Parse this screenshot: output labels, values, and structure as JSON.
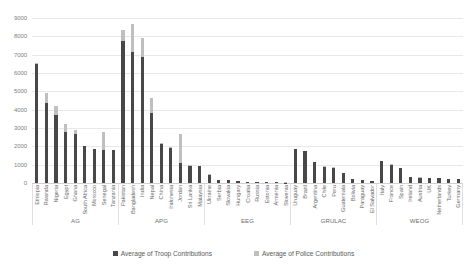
{
  "chart_data": {
    "type": "bar",
    "stacked": true,
    "title": "",
    "subtitle": "",
    "xlabel": "",
    "ylabel": "",
    "ylim": [
      0,
      9000
    ],
    "yticks": [
      0,
      1000,
      2000,
      3000,
      4000,
      5000,
      6000,
      7000,
      8000,
      9000
    ],
    "ytick_labels": [
      "0",
      "1000",
      "2000",
      "3000",
      "4000",
      "5000",
      "6000",
      "7000",
      "8000",
      "9000"
    ],
    "grid": true,
    "legend_position": "bottom",
    "categories": [
      "Ethiopia",
      "Rwanda",
      "Nigeria",
      "Egypt",
      "Ghana",
      "South Africa",
      "Morocco",
      "Senegal",
      "Tanzania",
      "Pakistan",
      "Bangladesh",
      "India",
      "Nepal",
      "China",
      "Indonesia",
      "Jordan",
      "Sri Lanka",
      "Malaysia",
      "Ukraine",
      "Serbia",
      "Slovakia",
      "Hungary",
      "Croatia",
      "Russia",
      "Estonia",
      "Armenia",
      "Slovenia",
      "Uruguay",
      "Brazil",
      "Argentina",
      "Chile",
      "Peru",
      "Guatemala",
      "Bolivia",
      "Paraguay",
      "El Salvador",
      "Italy",
      "France",
      "Spain",
      "Ireland",
      "Austria",
      "UK",
      "Netherlands",
      "Turkey",
      "Germany"
    ],
    "series": [
      {
        "name": "Average of Troop Contributions",
        "color": "#484848",
        "values": [
          6490,
          4350,
          3700,
          2800,
          2650,
          2000,
          1850,
          1790,
          1780,
          7760,
          7150,
          6900,
          3800,
          2150,
          1930,
          1100,
          950,
          920,
          450,
          160,
          150,
          90,
          70,
          60,
          45,
          35,
          25,
          1860,
          1750,
          1150,
          900,
          840,
          520,
          200,
          170,
          120,
          1200,
          1000,
          820,
          330,
          300,
          290,
          250,
          230,
          210
        ]
      },
      {
        "name": "Average of Police Contributions",
        "color": "#bfbfbf",
        "values": [
          30,
          560,
          490,
          400,
          240,
          20,
          15,
          1010,
          15,
          590,
          1550,
          1010,
          820,
          15,
          40,
          1600,
          20,
          15,
          20,
          10,
          10,
          8,
          6,
          6,
          5,
          4,
          4,
          20,
          15,
          20,
          15,
          15,
          15,
          10,
          8,
          8,
          15,
          15,
          15,
          10,
          10,
          10,
          8,
          8,
          8
        ]
      }
    ],
    "groups": [
      {
        "name": "AG",
        "count": 9
      },
      {
        "name": "APG",
        "count": 9
      },
      {
        "name": "EEG",
        "count": 9
      },
      {
        "name": "GRULAC",
        "count": 9
      },
      {
        "name": "WEOG",
        "count": 9
      }
    ]
  },
  "legend": {
    "items": [
      {
        "label": "Average of Troop Contributions",
        "color": "#484848"
      },
      {
        "label": "Average of Police Contributions",
        "color": "#bfbfbf"
      }
    ]
  },
  "colors": {
    "troop": "#484848",
    "police": "#bfbfbf",
    "grid": "#e8e8e8",
    "text": "#595959",
    "background": "#ffffff"
  }
}
